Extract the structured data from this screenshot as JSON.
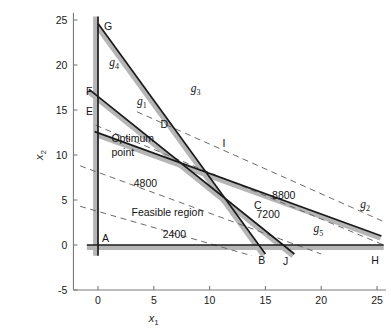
{
  "chart_data": {
    "type": "line",
    "title": "",
    "xlabel": "x1",
    "ylabel": "x2",
    "xlim": [
      -2.2,
      25.8
    ],
    "ylim": [
      -5,
      25.8
    ],
    "grid": false,
    "legend": "none",
    "xticks": [
      0,
      5,
      10,
      15,
      20,
      25
    ],
    "xtick_labels": [
      "0",
      "5",
      "10",
      "15",
      "20",
      "25"
    ],
    "yticks": [
      -5,
      0,
      5,
      10,
      15,
      20,
      25
    ],
    "ytick_labels": [
      "-5",
      "0",
      "5",
      "10",
      "15",
      "20",
      "25"
    ],
    "constraint_lines": [
      {
        "name": "g1",
        "label": "g1",
        "from": [
          -0.8,
          17.3
        ],
        "to": [
          17.6,
          -1.0
        ],
        "style": "solid-thick-shadow"
      },
      {
        "name": "g2",
        "label": "g2",
        "from": [
          -0.3,
          12.6
        ],
        "to": [
          25.4,
          1.0
        ],
        "style": "solid-thick-shadow"
      },
      {
        "name": "g3",
        "label": "g3",
        "from": [
          0.0,
          24.6
        ],
        "to": [
          15.0,
          -1.0
        ],
        "style": "solid-thick-shadow"
      },
      {
        "name": "g4",
        "label": "g4",
        "from": [
          0.0,
          25.4
        ],
        "to": [
          0.0,
          -1.2
        ],
        "style": "solid-thick-shadow"
      },
      {
        "name": "g5",
        "label": "g5",
        "from": [
          -1.0,
          0.0
        ],
        "to": [
          25.6,
          0.0
        ],
        "style": "solid-thick-shadow"
      }
    ],
    "objective_contours": [
      {
        "label": "2400",
        "from": [
          -1.6,
          4.3
        ],
        "to": [
          13.8,
          -1.2
        ]
      },
      {
        "label": "4800",
        "from": [
          -1.6,
          8.8
        ],
        "to": [
          20.0,
          -1.0
        ]
      },
      {
        "label": "7200",
        "from": [
          -0.2,
          13.3
        ],
        "to": [
          25.6,
          0.0
        ]
      },
      {
        "label": "8800",
        "from": [
          3.5,
          14.8
        ],
        "to": [
          25.6,
          2.6
        ]
      }
    ],
    "vertices": [
      {
        "label": "A",
        "x": 0.0,
        "y": 0.0
      },
      {
        "label": "B",
        "x": 14.1,
        "y": -0.9
      },
      {
        "label": "C",
        "x": 13.8,
        "y": 3.6
      },
      {
        "label": "D",
        "x": 5.5,
        "y": 12.6
      },
      {
        "label": "E",
        "x": 0.0,
        "y": 14.3
      },
      {
        "label": "F",
        "x": 0.0,
        "y": 16.6
      },
      {
        "label": "G",
        "x": 0.0,
        "y": 24.2
      },
      {
        "label": "H",
        "x": 24.3,
        "y": -0.9
      },
      {
        "label": "I",
        "x": 10.8,
        "y": 10.7
      },
      {
        "label": "J",
        "x": 16.3,
        "y": -1.0
      }
    ],
    "annotations": [
      {
        "text": "Optimum",
        "x": 1.2,
        "y": 11.5
      },
      {
        "text": "point",
        "x": 1.2,
        "y": 9.9
      },
      {
        "text": "Feasible region",
        "x": 3.0,
        "y": 3.2
      },
      {
        "text": "4800",
        "x": 3.2,
        "y": 6.5
      },
      {
        "text": "2400",
        "x": 5.8,
        "y": 0.8
      },
      {
        "text": "7200",
        "x": 14.2,
        "y": 3.0
      },
      {
        "text": "8800",
        "x": 15.6,
        "y": 5.1
      }
    ],
    "g_label_positions": [
      {
        "label": "g1",
        "x": 3.5,
        "y": 15.6
      },
      {
        "label": "g2",
        "x": 23.5,
        "y": 4.1
      },
      {
        "label": "g3",
        "x": 8.3,
        "y": 17.0
      },
      {
        "label": "g4",
        "x": 1.0,
        "y": 19.9
      },
      {
        "label": "g5",
        "x": 19.3,
        "y": 1.4
      }
    ]
  },
  "colors": {
    "axis": "#7a7a7a",
    "line": "#1a1a1a",
    "shadow": "#b5b5b5",
    "dashed": "#6b6b6b",
    "text": "#141414",
    "background": "#ffffff"
  },
  "axes": {
    "x_title_main": "x",
    "x_title_sub": "1",
    "y_title_main": "x",
    "y_title_sub": "2"
  }
}
